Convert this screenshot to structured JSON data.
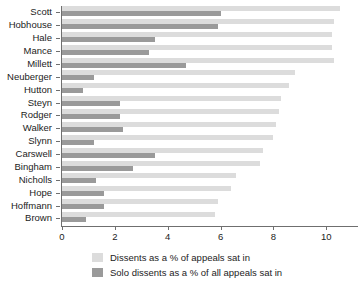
{
  "chart_data": {
    "type": "bar",
    "orientation": "horizontal",
    "title": "",
    "subtitle": "",
    "xlabel": "",
    "ylabel": "",
    "xlim": [
      0,
      11.2
    ],
    "xticks": [
      0,
      2,
      4,
      6,
      8,
      10
    ],
    "xtick_labels": [
      "0",
      "2",
      "4",
      "6",
      "8",
      "10"
    ],
    "grid": false,
    "legend_position": "bottom",
    "categories": [
      "Scott",
      "Hobhouse",
      "Hale",
      "Mance",
      "Millett",
      "Neuberger",
      "Hutton",
      "Steyn",
      "Rodger",
      "Walker",
      "Slynn",
      "Carswell",
      "Bingham",
      "Nicholls",
      "Hope",
      "Hoffmann",
      "Brown"
    ],
    "series": [
      {
        "name": "Dissents as a % of appeals sat in",
        "color": "#dcdcdc",
        "values": [
          10.5,
          10.3,
          10.2,
          10.2,
          10.3,
          8.8,
          8.6,
          8.3,
          8.2,
          8.1,
          8.0,
          7.6,
          7.5,
          6.6,
          6.4,
          5.9,
          5.8
        ]
      },
      {
        "name": "Solo dissents as a % of all appeals sat in",
        "color": "#9a9a9a",
        "values": [
          6.0,
          5.9,
          3.5,
          3.3,
          4.7,
          1.2,
          0.8,
          2.2,
          2.2,
          2.3,
          1.2,
          3.5,
          2.7,
          1.3,
          1.6,
          1.6,
          0.9
        ]
      }
    ]
  },
  "legend": {
    "items": [
      {
        "label": "Dissents as a % of appeals sat in",
        "color": "#dcdcdc"
      },
      {
        "label": "Solo dissents as a % of all appeals sat in",
        "color": "#9a9a9a"
      }
    ]
  }
}
